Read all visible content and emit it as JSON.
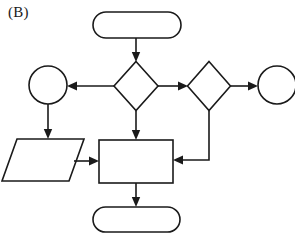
{
  "figure": {
    "panel_label": "(B)",
    "stroke_color": "#1a1a1a",
    "fill_color": "#ffffff",
    "background_color": "#ffffff",
    "width": 295,
    "height": 236
  },
  "diagram": {
    "type": "flowchart",
    "nodes": [
      {
        "id": "start-terminator",
        "shape": "rounded-rectangle",
        "role": "terminator",
        "label": "",
        "x": 93,
        "y": 12,
        "width": 88,
        "height": 26
      },
      {
        "id": "center-decision",
        "shape": "diamond",
        "role": "decision",
        "label": "",
        "cx": 136,
        "cy": 86,
        "width": 44,
        "height": 49
      },
      {
        "id": "left-connector-circle",
        "shape": "circle",
        "role": "connector",
        "label": "",
        "cx": 48,
        "cy": 85,
        "r": 19
      },
      {
        "id": "right-decision",
        "shape": "diamond",
        "role": "decision",
        "label": "",
        "cx": 209,
        "cy": 86,
        "width": 43,
        "height": 49
      },
      {
        "id": "right-connector-circle",
        "shape": "circle",
        "role": "connector",
        "label": "",
        "cx": 277,
        "cy": 85,
        "r": 19,
        "clipped": "right-edge"
      },
      {
        "id": "input-parallelogram",
        "shape": "parallelogram",
        "role": "input-output",
        "label": "",
        "x": 2,
        "y": 139,
        "width": 82,
        "height": 42
      },
      {
        "id": "process-rectangle",
        "shape": "rectangle",
        "role": "process",
        "label": "",
        "x": 99,
        "y": 140,
        "width": 74,
        "height": 43
      },
      {
        "id": "end-terminator",
        "shape": "rounded-rectangle",
        "role": "terminator",
        "label": "",
        "x": 93,
        "y": 207,
        "width": 87,
        "height": 25
      }
    ],
    "edges": [
      {
        "id": "start-to-center",
        "from": "start-terminator",
        "to": "center-decision",
        "label": "",
        "direction": "down"
      },
      {
        "id": "center-to-left-circle",
        "from": "center-decision",
        "to": "left-connector-circle",
        "label": "",
        "direction": "left"
      },
      {
        "id": "center-to-right-decision",
        "from": "center-decision",
        "to": "right-decision",
        "label": "",
        "direction": "right"
      },
      {
        "id": "center-to-process",
        "from": "center-decision",
        "to": "process-rectangle",
        "label": "",
        "direction": "down"
      },
      {
        "id": "right-decision-to-right-circle",
        "from": "right-decision",
        "to": "right-connector-circle",
        "label": "",
        "direction": "right"
      },
      {
        "id": "right-decision-to-process",
        "from": "right-decision",
        "to": "process-rectangle",
        "label": "",
        "direction": "down-then-left"
      },
      {
        "id": "left-circle-to-parallelogram",
        "from": "left-connector-circle",
        "to": "input-parallelogram",
        "label": "",
        "direction": "down"
      },
      {
        "id": "parallelogram-to-process",
        "from": "input-parallelogram",
        "to": "process-rectangle",
        "label": "",
        "direction": "right"
      },
      {
        "id": "process-to-end",
        "from": "process-rectangle",
        "to": "end-terminator",
        "label": "",
        "direction": "down"
      }
    ]
  }
}
